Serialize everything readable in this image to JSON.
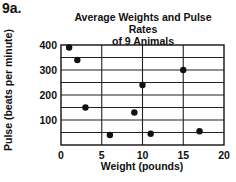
{
  "figure_label": "9a.",
  "chart_data": {
    "type": "scatter",
    "title": "Average Weights and Pulse Rates of 9 Animals",
    "title_lines": [
      "Average Weights and Pulse Rates",
      "of 9 Animals"
    ],
    "xlabel": "Weight (pounds)",
    "ylabel": "Pulse (beats per minute)",
    "xlim": [
      0,
      20
    ],
    "ylim": [
      0,
      400
    ],
    "x_ticks": [
      0,
      5,
      10,
      15,
      20
    ],
    "y_ticks": [
      100,
      200,
      300,
      400
    ],
    "grid": true,
    "x_grid_step": 5,
    "y_grid_step": 50,
    "legend": null,
    "series": [
      {
        "name": "Animals",
        "points": [
          {
            "x": 1,
            "y": 390
          },
          {
            "x": 2,
            "y": 340
          },
          {
            "x": 3,
            "y": 150
          },
          {
            "x": 6,
            "y": 40
          },
          {
            "x": 9,
            "y": 130
          },
          {
            "x": 10,
            "y": 240
          },
          {
            "x": 11,
            "y": 45
          },
          {
            "x": 15,
            "y": 300
          },
          {
            "x": 17,
            "y": 55
          }
        ]
      }
    ],
    "marker_color": "#111111"
  }
}
